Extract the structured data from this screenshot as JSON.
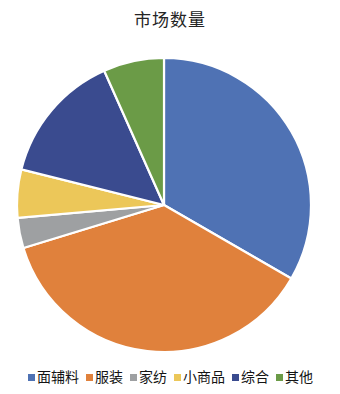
{
  "chart_data": {
    "type": "pie",
    "title": "市场数量",
    "xlabel": "",
    "ylabel": "",
    "legend_position": "bottom",
    "grid": false,
    "start_angle_deg": 0,
    "direction": "clockwise",
    "categories": [
      "面辅料",
      "服装",
      "家纺",
      "小商品",
      "综合",
      "其他"
    ],
    "values": [
      33.3,
      36.9,
      3.3,
      5.3,
      14.5,
      6.7
    ],
    "colors": [
      "#4f72b4",
      "#e0813c",
      "#9ea0a2",
      "#ecc759",
      "#3a4b8f",
      "#6b9b47"
    ],
    "slices": [
      {
        "label": "面辅料",
        "value": 33.3,
        "color": "#4f72b4",
        "start_deg": 0,
        "end_deg": 120
      },
      {
        "label": "服装",
        "value": 36.9,
        "color": "#e0813c",
        "start_deg": 120,
        "end_deg": 253
      },
      {
        "label": "家纺",
        "value": 3.3,
        "color": "#9ea0a2",
        "start_deg": 253,
        "end_deg": 265
      },
      {
        "label": "小商品",
        "value": 5.3,
        "color": "#ecc759",
        "start_deg": 265,
        "end_deg": 284
      },
      {
        "label": "综合",
        "value": 14.5,
        "color": "#3a4b8f",
        "start_deg": 284,
        "end_deg": 336
      },
      {
        "label": "其他",
        "value": 6.7,
        "color": "#6b9b47",
        "start_deg": 336,
        "end_deg": 360
      }
    ]
  },
  "chart": {
    "title": "市场数量",
    "geometry": {
      "cx": 164,
      "cy": 165,
      "r": 147
    }
  },
  "legend": {
    "items": [
      {
        "label": "面辅料",
        "color": "#4f72b4"
      },
      {
        "label": "服装",
        "color": "#e0813c"
      },
      {
        "label": "家纺",
        "color": "#9ea0a2"
      },
      {
        "label": "小商品",
        "color": "#ecc759"
      },
      {
        "label": "综合",
        "color": "#3a4b8f"
      },
      {
        "label": "其他",
        "color": "#6b9b47"
      }
    ]
  }
}
